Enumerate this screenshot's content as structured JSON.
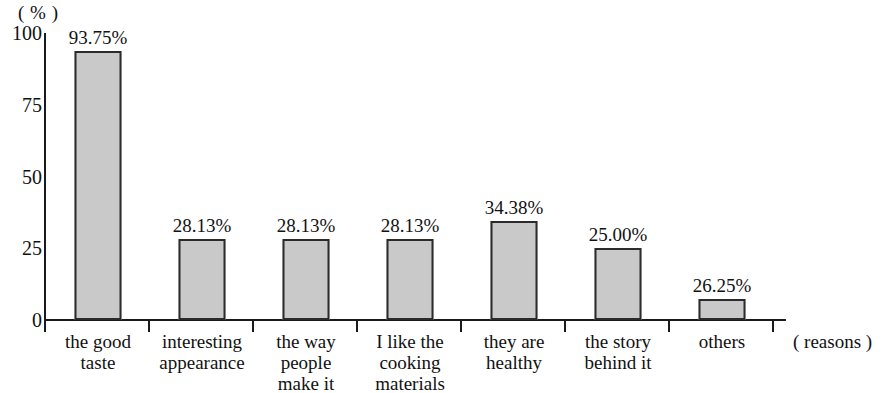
{
  "chart_data": {
    "type": "bar",
    "title": "",
    "xlabel": "( reasons )",
    "ylabel": "( % )",
    "ylim": [
      0,
      100
    ],
    "grid": false,
    "legend": null,
    "y_ticks": [
      "0",
      "25",
      "50",
      "75",
      "100"
    ],
    "y_tick_values": [
      0,
      25,
      50,
      75,
      100
    ],
    "categories": [
      "the good\ntaste",
      "interesting\nappearance",
      "the way\npeople\nmake it",
      "I like the\ncooking\nmaterials",
      "they are\nhealthy",
      "the story\nbehind it",
      "others"
    ],
    "values": [
      93.75,
      28.13,
      28.13,
      28.13,
      34.38,
      25.0,
      26.25
    ],
    "data_labels": [
      "93.75%",
      "28.13%",
      "28.13%",
      "28.13%",
      "34.38%",
      "25.00%",
      "26.25%"
    ],
    "drawn_heights": [
      93.75,
      28.13,
      28.13,
      28.13,
      34.38,
      25.0,
      7.3
    ],
    "bar_fill_color": "#c9c9c9",
    "bar_border_color": "#2b2b2b",
    "axis_color": "#1a1a1a",
    "background_color": "#ffffff"
  }
}
